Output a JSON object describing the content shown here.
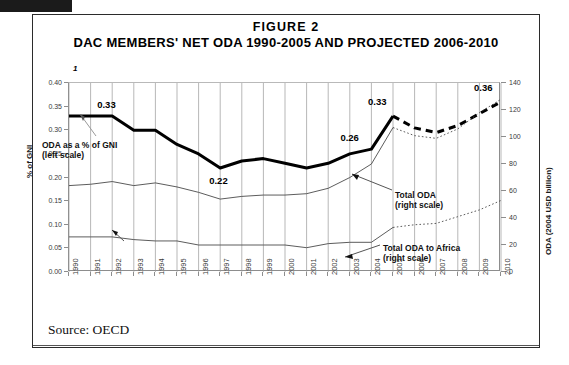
{
  "figure": {
    "number": "FIGURE 2",
    "title": "DAC MEMBERS' NET ODA 1990-2005 AND PROJECTED 2006-2010",
    "footnote_marker": "1",
    "source": "Source: OECD"
  },
  "annotations": [
    {
      "id": "oda-gni",
      "line1": "ODA as a % of GNI",
      "line2": "(left scale)"
    },
    {
      "id": "total-oda",
      "line1": "Total ODA",
      "line2": "(right scale)"
    },
    {
      "id": "total-oda-africa",
      "line1": "Total ODA to Africa",
      "line2": "(right scale)"
    }
  ],
  "chart_data": {
    "type": "line",
    "title": "DAC MEMBERS' NET ODA 1990-2005 AND PROJECTED 2006-2010",
    "xlabel": "",
    "ylabel": "% of GNI",
    "y2label": "ODA (2004 USD billion)",
    "grid": "vertical-only",
    "legend": "inline-annotations",
    "x": [
      1990,
      1991,
      1992,
      1993,
      1994,
      1995,
      1996,
      1997,
      1998,
      1999,
      2000,
      2001,
      2002,
      2003,
      2004,
      2005,
      2006,
      2007,
      2008,
      2009,
      2010
    ],
    "xlim": [
      1990,
      2010
    ],
    "ylim": [
      0.0,
      0.4
    ],
    "yticks": [
      "0.00",
      "0.05",
      "0.10",
      "0.15",
      "0.20",
      "0.25",
      "0.30",
      "0.35",
      "0.40"
    ],
    "y2lim": [
      0,
      140
    ],
    "y2ticks": [
      "0",
      "20",
      "40",
      "60",
      "80",
      "100",
      "120",
      "140"
    ],
    "series": [
      {
        "name": "ODA as a % of GNI (left scale)",
        "axis": "left",
        "style": "thick-solid-black",
        "values": [
          0.33,
          0.33,
          0.33,
          0.3,
          0.3,
          0.27,
          0.25,
          0.22,
          0.235,
          0.24,
          0.23,
          0.22,
          0.23,
          0.25,
          0.26,
          0.33,
          null,
          null,
          null,
          null,
          null
        ]
      },
      {
        "name": "ODA as a % of GNI (projected)",
        "axis": "left",
        "style": "thick-dashed-black",
        "values": [
          null,
          null,
          null,
          null,
          null,
          null,
          null,
          null,
          null,
          null,
          null,
          null,
          null,
          null,
          null,
          0.33,
          0.305,
          0.295,
          0.31,
          0.335,
          0.36
        ]
      },
      {
        "name": "Total ODA (right scale)",
        "axis": "right",
        "style": "thin-solid-gray",
        "values": [
          64,
          65,
          67,
          64,
          66,
          63,
          59,
          54,
          56,
          57,
          57,
          58,
          62,
          70,
          80,
          107,
          null,
          null,
          null,
          null,
          null
        ]
      },
      {
        "name": "Total ODA (right scale, projected)",
        "axis": "right",
        "style": "thin-dotted-gray",
        "values": [
          null,
          null,
          null,
          null,
          null,
          null,
          null,
          null,
          null,
          null,
          null,
          null,
          null,
          null,
          null,
          107,
          101,
          99,
          106,
          118,
          128
        ]
      },
      {
        "name": "Total ODA to Africa (right scale)",
        "axis": "right",
        "style": "thin-solid-gray",
        "values": [
          26,
          26,
          26,
          24,
          23,
          23,
          20,
          20,
          20,
          20,
          20,
          18,
          21,
          22,
          22,
          33,
          null,
          null,
          null,
          null,
          null
        ]
      },
      {
        "name": "Total ODA to Africa (right scale, projected)",
        "axis": "right",
        "style": "thin-dotted-gray",
        "values": [
          null,
          null,
          null,
          null,
          null,
          null,
          null,
          null,
          null,
          null,
          null,
          null,
          null,
          null,
          null,
          33,
          35,
          36,
          41,
          46,
          53
        ]
      }
    ],
    "data_labels": [
      {
        "text": "0.33",
        "year": 1992,
        "value": 0.33
      },
      {
        "text": "0.22",
        "year": 1997,
        "value": 0.22
      },
      {
        "text": "0.26",
        "year": 2004,
        "value": 0.26
      },
      {
        "text": "0.33",
        "year": 2005,
        "value": 0.33
      },
      {
        "text": "0.36",
        "year": 2010,
        "value": 0.36
      }
    ]
  }
}
